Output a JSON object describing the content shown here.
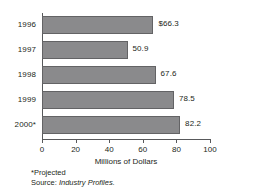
{
  "chart_data": {
    "type": "bar",
    "orientation": "horizontal",
    "title": "",
    "subtitle": "",
    "categories": [
      "1996",
      "1997",
      "1998",
      "1999",
      "2000*"
    ],
    "values": [
      66.3,
      50.9,
      67.6,
      78.5,
      82.2
    ],
    "value_labels": [
      "$66.3",
      "50.9",
      "67.6",
      "78.5",
      "82.2"
    ],
    "xlabel": "Millions of Dollars",
    "ylabel": "",
    "xlim": [
      0,
      100
    ],
    "xticks": [
      0,
      20,
      40,
      60,
      80,
      100
    ],
    "xtick_labels": [
      "0",
      "20",
      "40",
      "60",
      "80",
      "100"
    ],
    "grid": false,
    "legend": false,
    "bar_color": "#8a8a8c",
    "bar_border_color": "#636365",
    "axis_color": "#58595b",
    "text_color": "#231f20"
  },
  "notes": {
    "projected": "*Projected",
    "source_prefix": "Source: ",
    "source_name": "Industry Profiles."
  }
}
